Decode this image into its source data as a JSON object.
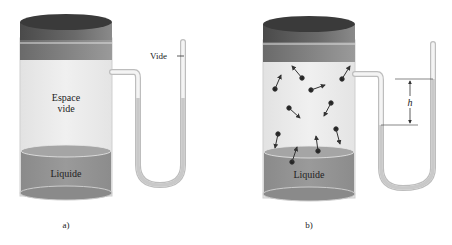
{
  "panel_a": {
    "caption": "a)",
    "empty_space_line1": "Espace",
    "empty_space_line2": "vide",
    "liquid_label": "Liquide",
    "vacuum_label": "Vide"
  },
  "panel_b": {
    "caption": "b)",
    "liquid_label": "Liquide",
    "height_label": "h",
    "molecule_count": 12
  },
  "colors": {
    "lid_top": "#3a3a3a",
    "lid_side": "#5a5a5a",
    "liquid": "#8c8c8c",
    "liquid_surface": "#a0a0a0",
    "glass": "#e9e9e9",
    "tube": "#d6d6d6",
    "mercury": "#c8c8c8"
  }
}
